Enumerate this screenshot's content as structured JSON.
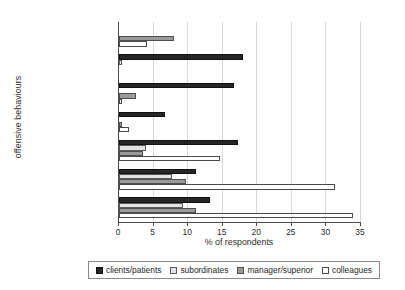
{
  "chart_data": {
    "type": "bar",
    "orientation": "horizontal",
    "title": "",
    "xlabel": "% of respondents",
    "ylabel": "offensive behaviours",
    "xlim": [
      0,
      35
    ],
    "xticks": [
      0,
      5,
      10,
      15,
      20,
      25,
      30,
      35
    ],
    "grid": true,
    "legend_position": "bottom",
    "categories": [
      "bullying",
      "physical violence",
      "threats of violence",
      "sexual harassment",
      "unpleasant teasing",
      "conflicts and quarrels",
      "gossip and slander"
    ],
    "series": [
      {
        "name": "clients/patients",
        "color": "#262626",
        "values": [
          0.0,
          18.0,
          16.6,
          6.6,
          17.2,
          11.1,
          13.1
        ]
      },
      {
        "name": "subordinates",
        "color": "#e2e2e2",
        "values": [
          0.0,
          0.4,
          0.0,
          0.0,
          3.9,
          7.7,
          9.2
        ]
      },
      {
        "name": "manager/superior",
        "color": "#9a9a9a",
        "values": [
          8.0,
          0.0,
          2.5,
          0.5,
          3.4,
          9.7,
          11.2
        ]
      },
      {
        "name": "colleagues",
        "color": "#ffffff",
        "values": [
          4.0,
          0.0,
          0.4,
          1.5,
          14.6,
          31.3,
          33.9
        ]
      }
    ]
  },
  "legend": {
    "items": [
      {
        "label": "clients/patients",
        "swatch": "legend-swatch-clients"
      },
      {
        "label": "subordinates",
        "swatch": "legend-swatch-subordinates"
      },
      {
        "label": "manager/superior",
        "swatch": "legend-swatch-manager"
      },
      {
        "label": "colleagues",
        "swatch": "legend-swatch-colleagues"
      }
    ]
  },
  "title_fragment": ""
}
